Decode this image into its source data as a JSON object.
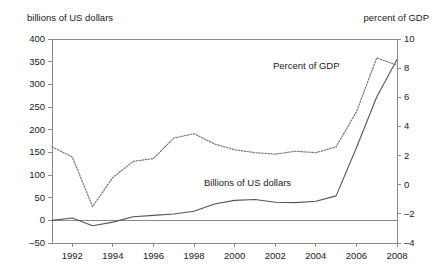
{
  "chart_data": {
    "type": "line",
    "title": "",
    "xlabel": "",
    "ylabel": "billions of US dollars",
    "y2label": "percent of GDP",
    "grid": false,
    "legend_position": "inline-annotation",
    "x": [
      1991,
      1992,
      1993,
      1994,
      1995,
      1996,
      1997,
      1998,
      1999,
      2000,
      2001,
      2002,
      2003,
      2004,
      2005,
      2006,
      2007,
      2008
    ],
    "xlim": [
      1991,
      2008
    ],
    "xticks": [
      "1992",
      "1994",
      "1996",
      "1998",
      "2000",
      "2002",
      "2004",
      "2006",
      "2008"
    ],
    "xtick_values": [
      1992,
      1994,
      1996,
      1998,
      2000,
      2002,
      2004,
      2006,
      2008
    ],
    "ylim": [
      -50,
      400
    ],
    "yticks": [
      "400",
      "350",
      "300",
      "250",
      "200",
      "150",
      "100",
      "50",
      "0",
      "-50"
    ],
    "ytick_values": [
      400,
      350,
      300,
      250,
      200,
      150,
      100,
      50,
      0,
      -50
    ],
    "y2lim": [
      -4,
      10
    ],
    "y2ticks": [
      "10",
      "8",
      "6",
      "4",
      "2",
      "0",
      "-2",
      "-4"
    ],
    "y2tick_values": [
      10,
      8,
      6,
      4,
      2,
      0,
      -2,
      -4
    ],
    "zero_line": 0,
    "series": [
      {
        "name": "Billions of US dollars",
        "axis": "left",
        "style": "solid",
        "color": "#555555",
        "values": [
          0,
          5,
          -12,
          -4,
          8,
          11,
          14,
          20,
          36,
          44,
          46,
          40,
          39,
          42,
          54,
          160,
          272,
          355
        ]
      },
      {
        "name": "Percent of GDP",
        "axis": "right",
        "style": "dotted",
        "color": "#777777",
        "values": [
          2.6,
          1.9,
          -1.5,
          0.5,
          1.6,
          1.8,
          3.2,
          3.5,
          2.8,
          2.4,
          2.2,
          2.1,
          2.3,
          2.2,
          2.6,
          5.0,
          8.7,
          8.2
        ]
      }
    ],
    "annotations": [
      {
        "text": "Percent of GDP",
        "x": 2004.6,
        "y2": 8.0
      },
      {
        "text": "Billions of US dollars",
        "x": 2001.0,
        "y": 95
      }
    ]
  },
  "plot_area": {
    "left": 52,
    "right": 397,
    "top": 39,
    "bottom": 243
  }
}
